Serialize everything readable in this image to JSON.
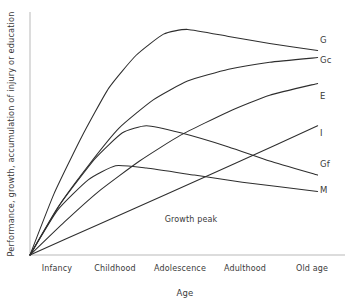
{
  "chart_data": {
    "type": "line",
    "title": "",
    "subtitle": "",
    "xlabel": "Age",
    "ylabel": "Performance, growth, accumulation of injury or education",
    "categories": [
      "Infancy",
      "Childhood",
      "Adolescence",
      "Adulthood",
      "Old age"
    ],
    "x": [
      0,
      1,
      2,
      3,
      4
    ],
    "xlim": [
      0,
      4.6
    ],
    "ylim": [
      0,
      100
    ],
    "grid": false,
    "legend_position": "right-of-line-ends",
    "annotations": [
      {
        "text": "Growth peak",
        "x": 2.05,
        "y": 16
      }
    ],
    "series": [
      {
        "name": "G",
        "label": "G",
        "description": "General intelligence: steep early rise, peak at adolescence, slow decline",
        "x": [
          0,
          0.35,
          0.75,
          1.15,
          1.55,
          1.95,
          2.3,
          2.9,
          3.5,
          4.2
        ],
        "values": [
          0,
          26,
          50,
          71,
          85,
          94,
          96,
          93,
          90,
          87
        ]
      },
      {
        "name": "Gc",
        "label": "Gc",
        "description": "Crystallised ability: rises and plateaus high",
        "x": [
          0,
          0.4,
          0.85,
          1.3,
          1.8,
          2.3,
          2.9,
          3.5,
          4.2
        ],
        "values": [
          0,
          20,
          38,
          54,
          66,
          74,
          79,
          82,
          84
        ]
      },
      {
        "name": "E",
        "label": "E",
        "description": "Education / accumulated knowledge: near-linear continued rise",
        "x": [
          0,
          0.5,
          1.0,
          1.6,
          2.2,
          2.9,
          3.5,
          4.2
        ],
        "values": [
          0,
          14,
          27,
          40,
          51,
          61,
          68,
          73
        ]
      },
      {
        "name": "I",
        "label": "I",
        "description": "Accumulated injury: straight line rising steadily with age",
        "x": [
          0,
          1.0,
          2.0,
          3.0,
          4.2
        ],
        "values": [
          0,
          13,
          26,
          39,
          55
        ]
      },
      {
        "name": "Gf",
        "label": "Gf",
        "description": "Fluid ability: rises to peak in adolescence then declines",
        "x": [
          0,
          0.45,
          0.95,
          1.35,
          1.7,
          2.2,
          2.9,
          3.5,
          4.2
        ],
        "values": [
          0,
          22,
          41,
          52,
          55,
          52,
          46,
          40,
          34
        ]
      },
      {
        "name": "M",
        "label": "M",
        "description": "Memory span: early peak in childhood then gentle decline",
        "x": [
          0,
          0.4,
          0.85,
          1.25,
          1.7,
          2.4,
          3.1,
          4.2
        ],
        "values": [
          0,
          19,
          32,
          38,
          37,
          34,
          31,
          27
        ]
      }
    ],
    "series_labels": [
      {
        "name": "G",
        "text": "G"
      },
      {
        "name": "Gc",
        "text": "Gc"
      },
      {
        "name": "E",
        "text": "E"
      },
      {
        "name": "I",
        "text": "I"
      },
      {
        "name": "Gf",
        "text": "Gf"
      },
      {
        "name": "M",
        "text": "M"
      }
    ],
    "colors": {
      "background": "#ffffff",
      "curve": "#2e2e2e",
      "axis": "#b9b9b9",
      "text": "#3a3a3a"
    }
  }
}
